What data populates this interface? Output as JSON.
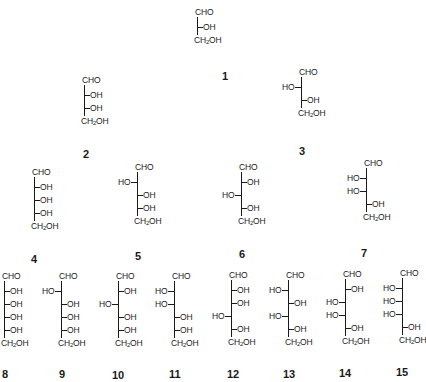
{
  "figure": {
    "top_group": "CHO",
    "bottom_group": "CH2OH",
    "bottom_group_parts": [
      "CH",
      "2",
      "OH"
    ],
    "left_label": "HO",
    "right_label": "OH",
    "structures": [
      {
        "id": "1",
        "label": "1",
        "substituents": [
          "R"
        ]
      },
      {
        "id": "2",
        "label": "2",
        "substituents": [
          "R",
          "R"
        ]
      },
      {
        "id": "3",
        "label": "3",
        "substituents": [
          "L",
          "R"
        ]
      },
      {
        "id": "4",
        "label": "4",
        "substituents": [
          "R",
          "R",
          "R"
        ]
      },
      {
        "id": "5",
        "label": "5",
        "substituents": [
          "L",
          "R",
          "R"
        ]
      },
      {
        "id": "6",
        "label": "6",
        "substituents": [
          "R",
          "L",
          "R"
        ]
      },
      {
        "id": "7",
        "label": "7",
        "substituents": [
          "L",
          "L",
          "R"
        ]
      },
      {
        "id": "8",
        "label": "8",
        "substituents": [
          "R",
          "R",
          "R",
          "R"
        ]
      },
      {
        "id": "9",
        "label": "9",
        "substituents": [
          "L",
          "R",
          "R",
          "R"
        ]
      },
      {
        "id": "10",
        "label": "10",
        "substituents": [
          "R",
          "L",
          "R",
          "R"
        ]
      },
      {
        "id": "11",
        "label": "11",
        "substituents": [
          "L",
          "L",
          "R",
          "R"
        ]
      },
      {
        "id": "12",
        "label": "12",
        "substituents": [
          "R",
          "R",
          "L",
          "R"
        ]
      },
      {
        "id": "13",
        "label": "13",
        "substituents": [
          "L",
          "R",
          "L",
          "R"
        ]
      },
      {
        "id": "14",
        "label": "14",
        "substituents": [
          "R",
          "L",
          "L",
          "R"
        ]
      },
      {
        "id": "15",
        "label": "15",
        "substituents": [
          "L",
          "L",
          "L",
          "R"
        ]
      }
    ]
  }
}
